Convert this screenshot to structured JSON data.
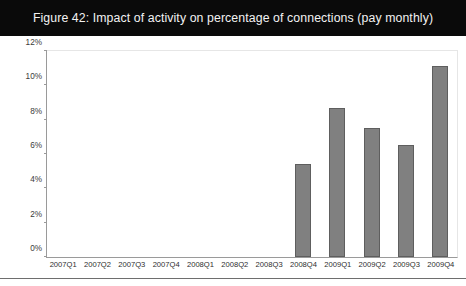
{
  "figure": {
    "title": "Figure 42: Impact of activity on percentage of connections (pay monthly)"
  },
  "chart_data": {
    "type": "bar",
    "title": "Figure 42: Impact of activity on percentage of connections (pay monthly)",
    "xlabel": "",
    "ylabel": "",
    "ylim": [
      0,
      12
    ],
    "yticks": [
      "0%",
      "2%",
      "4%",
      "6%",
      "8%",
      "10%",
      "12%"
    ],
    "ytick_values": [
      0,
      2,
      4,
      6,
      8,
      10,
      12
    ],
    "grid": false,
    "legend": null,
    "bar_color": "#808080",
    "bar_border_color": "#5e5e5e",
    "categories": [
      "2007Q1",
      "2007Q2",
      "2007Q3",
      "2007Q4",
      "2008Q1",
      "2008Q2",
      "2008Q3",
      "2008Q4",
      "2009Q1",
      "2009Q2",
      "2009Q3",
      "2009Q4"
    ],
    "values": [
      0,
      0,
      0,
      0,
      0,
      0,
      0,
      5.4,
      8.7,
      7.5,
      6.5,
      11.1
    ]
  }
}
